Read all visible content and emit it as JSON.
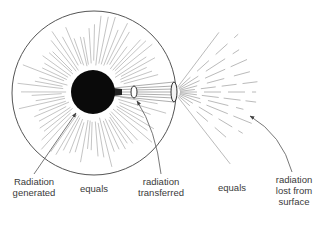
{
  "diagram": {
    "colors": {
      "outline": "#555555",
      "rays": "#b5b5b5",
      "core": "#0a0a0a",
      "text": "#3a3a3a",
      "background": "#ffffff"
    },
    "shapes": {
      "outer_sphere": {
        "cx": 94,
        "cy": 93,
        "r": 82
      },
      "core": {
        "cx": 93,
        "cy": 92,
        "r": 22
      },
      "inner_ellipse": {
        "cx": 134,
        "cy": 92,
        "rx": 3,
        "ry": 6
      },
      "surface_ellipse": {
        "cx": 174,
        "cy": 92,
        "rx": 3,
        "ry": 10
      }
    }
  },
  "labels": {
    "generated": {
      "line1": "Radiation",
      "line2": "generated"
    },
    "equals_1": "equals",
    "transferred": {
      "line1": "radiation",
      "line2": "transferred"
    },
    "equals_2": "equals",
    "lost": {
      "line1": "radiation",
      "line2": "lost from",
      "line3": "surface"
    }
  }
}
